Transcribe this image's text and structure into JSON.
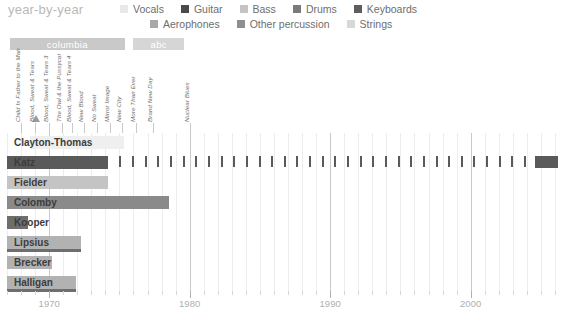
{
  "header": {
    "title": "year-by-year"
  },
  "legend": {
    "row1": [
      {
        "label": "Vocals",
        "color": "#e8e8e8"
      },
      {
        "label": "Guitar",
        "color": "#4a4a4a"
      },
      {
        "label": "Bass",
        "color": "#c4c4c4"
      },
      {
        "label": "Drums",
        "color": "#7a7a7a"
      },
      {
        "label": "Keyboards",
        "color": "#5e5e5e"
      }
    ],
    "row2": [
      {
        "label": "Aerophones",
        "color": "#a8a8a8"
      },
      {
        "label": "Other percussion",
        "color": "#8e8e8e"
      },
      {
        "label": "Strings",
        "color": "#d8d8d8"
      }
    ]
  },
  "label_bars": [
    {
      "name": "columbia",
      "start_year": 1967.2,
      "end_year": 1975.4,
      "color": "#c9c9c9"
    },
    {
      "name": "abc",
      "start_year": 1976.0,
      "end_year": 1979.6,
      "color": "#d6d6d6"
    }
  ],
  "albums": [
    {
      "title": "Child Is Father to the Man",
      "year": 1968.0,
      "award": false
    },
    {
      "title": "Blood, Sweat & Tears",
      "year": 1969.0,
      "award": true
    },
    {
      "title": "Blood, Sweat & Tears 3",
      "year": 1970.0,
      "award": false
    },
    {
      "title": "The Owl & the Pussycat",
      "year": 1970.9,
      "award": false
    },
    {
      "title": "Blood, Sweat & Tears 4",
      "year": 1971.6,
      "award": false
    },
    {
      "title": "New Blood",
      "year": 1972.5,
      "award": false
    },
    {
      "title": "No Sweat",
      "year": 1973.4,
      "award": false
    },
    {
      "title": "Mirror Image",
      "year": 1974.3,
      "award": false
    },
    {
      "title": "New City",
      "year": 1975.2,
      "award": false
    },
    {
      "title": "More Than Ever",
      "year": 1976.2,
      "award": false
    },
    {
      "title": "Brand New Day",
      "year": 1977.4,
      "award": false
    },
    {
      "title": "Nuclear Blues",
      "year": 1980.0,
      "award": false
    }
  ],
  "chart_data": {
    "type": "bar",
    "title": "year-by-year",
    "xlabel": "",
    "ylabel": "",
    "xlim": [
      1966.5,
      2007.0
    ],
    "grid": true,
    "legend_position": "top-right",
    "xticks_major": [
      1970,
      1980,
      1990,
      2000
    ],
    "xtick_labels": [
      "1970",
      "1980",
      "1990",
      "2000"
    ],
    "xtick_minor_step": 1,
    "categories": [
      "Clayton-Thomas",
      "Katz",
      "Fielder",
      "Colomby",
      "Kooper",
      "Lipsius",
      "Brecker",
      "Halligan"
    ],
    "series": [
      {
        "name": "Clayton-Thomas",
        "instrument": "Vocals",
        "color": "#efefef",
        "start_year": 1968.6,
        "end_year": 1975.3,
        "secondary": null,
        "markers": [],
        "end_block": null
      },
      {
        "name": "Katz",
        "instrument": "Guitar",
        "color": "#5a5a5a",
        "start_year": 1967.0,
        "end_year": 1974.2,
        "secondary": null,
        "markers": [
          1975.0,
          1975.9,
          1976.8,
          1977.7,
          1978.6,
          1979.5,
          1980.4,
          1981.3,
          1982.2,
          1983.1,
          1984.0,
          1984.9,
          1985.8,
          1986.7,
          1987.6,
          1988.5,
          1989.4,
          1990.3,
          1991.2,
          1992.1,
          1993.0,
          1993.9,
          1994.8,
          1995.7,
          1996.6,
          1997.5,
          1998.4,
          1999.3,
          2000.2,
          2001.1,
          2002.0,
          2002.9,
          2003.8
        ],
        "end_block": {
          "start_year": 2004.6,
          "end_year": 2006.2
        }
      },
      {
        "name": "Fielder",
        "instrument": "Bass",
        "color": "#c4c4c4",
        "start_year": 1967.0,
        "end_year": 1974.2,
        "secondary": null,
        "markers": [],
        "end_block": null
      },
      {
        "name": "Colomby",
        "instrument": "Drums",
        "color": "#8a8a8a",
        "start_year": 1967.0,
        "end_year": 1978.5,
        "secondary": null,
        "markers": [],
        "end_block": null
      },
      {
        "name": "Kooper",
        "instrument": "Keyboards",
        "color": "#6e6e6e",
        "start_year": 1967.0,
        "end_year": 1968.5,
        "secondary": null,
        "markers": [],
        "end_block": null
      },
      {
        "name": "Lipsius",
        "instrument": "Aerophones",
        "color": "#b2b2b2",
        "start_year": 1967.0,
        "end_year": 1972.3,
        "secondary": {
          "instrument": "Keyboards",
          "color": "#6e6e6e",
          "start_year": 1967.0,
          "end_year": 1972.3
        },
        "markers": [],
        "end_block": null
      },
      {
        "name": "Brecker",
        "instrument": "Aerophones",
        "color": "#b2b2b2",
        "start_year": 1967.0,
        "end_year": 1970.2,
        "secondary": null,
        "markers": [],
        "end_block": null
      },
      {
        "name": "Halligan",
        "instrument": "Aerophones",
        "color": "#b2b2b2",
        "start_year": 1967.0,
        "end_year": 1971.9,
        "secondary": {
          "instrument": "Keyboards",
          "color": "#6e6e6e",
          "start_year": 1967.0,
          "end_year": 1971.9
        },
        "markers": [],
        "end_block": null
      }
    ]
  }
}
